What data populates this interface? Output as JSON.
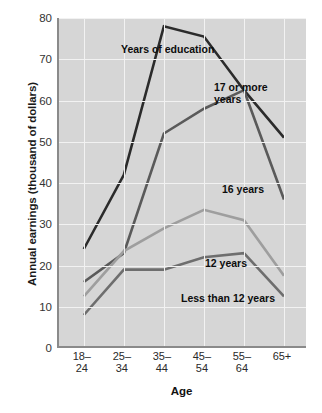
{
  "chart_data": {
    "type": "line",
    "title": "",
    "annotation_title": "Years of education",
    "xlabel": "Age",
    "ylabel": "Annual earnings (thousand of dollars)",
    "categories": [
      "18–24",
      "25–34",
      "35–44",
      "45–54",
      "55–64",
      "65+"
    ],
    "category_lines": [
      [
        "18–",
        "24"
      ],
      [
        "25–",
        "34"
      ],
      [
        "35–",
        "44"
      ],
      [
        "45–",
        "54"
      ],
      [
        "55–",
        "64"
      ],
      [
        "65+",
        ""
      ]
    ],
    "ylim": [
      0,
      80
    ],
    "yticks": [
      0,
      10,
      20,
      30,
      40,
      50,
      60,
      70,
      80
    ],
    "grid": true,
    "legend_position": "inline-annotations",
    "plot_background": "#d6d6d6",
    "gridline_color": "#f2f2f2",
    "axis_color": "#8a8a8a",
    "series": [
      {
        "name": "17 or more years",
        "label": "17 or more\nyears",
        "color": "#2b2b2b",
        "width": 2.6,
        "values": [
          24,
          42,
          78,
          75.5,
          62.5,
          51
        ]
      },
      {
        "name": "16 years",
        "label": "16 years",
        "color": "#5a5a5a",
        "width": 2.6,
        "values": [
          16,
          23,
          52,
          58,
          62.5,
          36
        ]
      },
      {
        "name": "12 years",
        "label": "12 years",
        "color": "#9e9e9e",
        "width": 2.6,
        "values": [
          12.5,
          23.5,
          29,
          33.5,
          31,
          17.5
        ]
      },
      {
        "name": "Less than 12 years",
        "label": "Less than 12 years",
        "color": "#6e6e6e",
        "width": 2.6,
        "values": [
          8,
          19,
          19,
          22,
          23,
          12.5
        ]
      }
    ]
  }
}
